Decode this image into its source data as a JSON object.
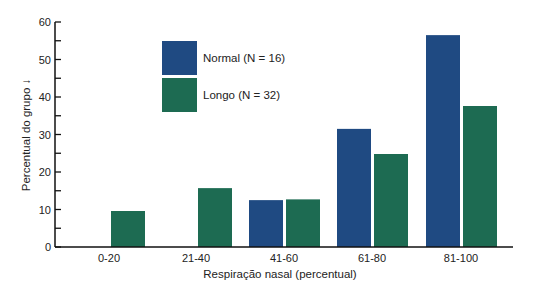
{
  "chart_data": {
    "type": "bar",
    "title": "",
    "xlabel": "Respiração nasal (percentual)",
    "ylabel": "Percentual do grupo ↓",
    "ylim": [
      0,
      60
    ],
    "yticks": [
      0,
      10,
      20,
      30,
      40,
      50,
      60
    ],
    "grid": false,
    "legend_position": "upper-left-inside",
    "categories": [
      "0-20",
      "21-40",
      "41-60",
      "61-80",
      "81-100"
    ],
    "series": [
      {
        "name": "Normal (N = 16)",
        "color": "#1f4a82",
        "values": [
          0,
          0,
          12.5,
          31.5,
          56.5
        ]
      },
      {
        "name": "Longo (N = 32)",
        "color": "#1d6b52",
        "values": [
          9.6,
          15.7,
          12.7,
          24.8,
          37.6
        ]
      }
    ]
  },
  "legend": {
    "items": [
      {
        "label": "Normal (N = 16)",
        "color": "#1f4a82"
      },
      {
        "label": "Longo (N = 32)",
        "color": "#1d6b52"
      }
    ]
  }
}
